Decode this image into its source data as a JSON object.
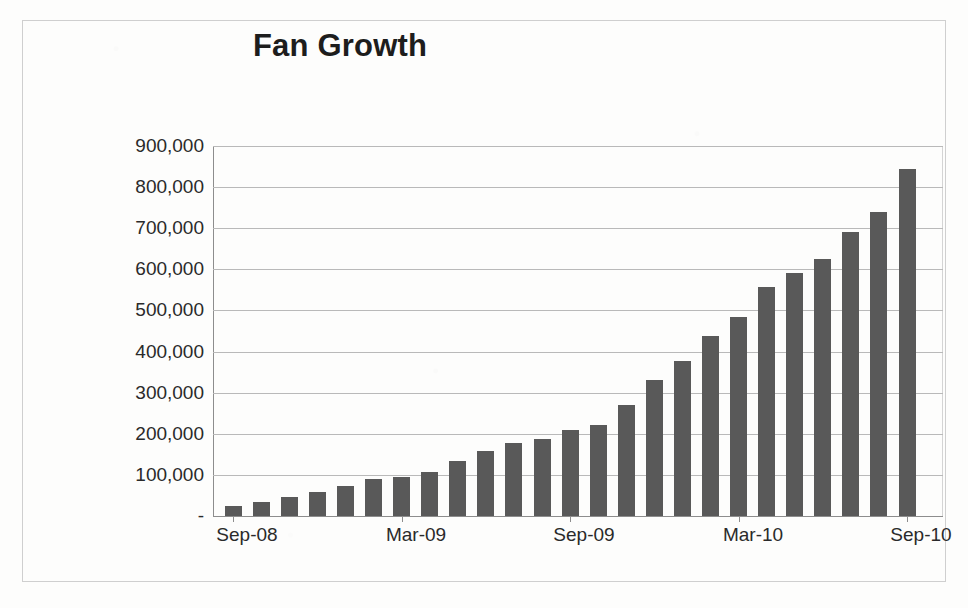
{
  "chart_data": {
    "type": "bar",
    "title": "Fan Growth",
    "xlabel": "",
    "ylabel": "",
    "ylim": [
      0,
      900000
    ],
    "grid": true,
    "legend": false,
    "y_ticks": [
      {
        "value": 900000,
        "label": "900,000"
      },
      {
        "value": 800000,
        "label": "800,000"
      },
      {
        "value": 700000,
        "label": "700,000"
      },
      {
        "value": 600000,
        "label": "600,000"
      },
      {
        "value": 500000,
        "label": "500,000"
      },
      {
        "value": 400000,
        "label": "400,000"
      },
      {
        "value": 300000,
        "label": "300,000"
      },
      {
        "value": 200000,
        "label": "200,000"
      },
      {
        "value": 100000,
        "label": "100,000"
      },
      {
        "value": 0,
        "label": "-"
      }
    ],
    "x_tick_labels": [
      "Sep-08",
      "Mar-09",
      "Sep-09",
      "Mar-10",
      "Sep-10"
    ],
    "x_tick_indices": [
      0,
      6,
      12,
      18,
      24
    ],
    "categories": [
      "Sep-08",
      "Oct-08",
      "Nov-08",
      "Dec-08",
      "Jan-09",
      "Feb-09",
      "Mar-09",
      "Apr-09",
      "May-09",
      "Jun-09",
      "Jul-09",
      "Aug-09",
      "Sep-09",
      "Oct-09",
      "Nov-09",
      "Dec-09",
      "Jan-10",
      "Feb-10",
      "Mar-10",
      "Apr-10",
      "May-10",
      "Jun-10",
      "Jul-10",
      "Aug-10",
      "Sep-10"
    ],
    "values": [
      25000,
      33000,
      45000,
      58000,
      73000,
      90000,
      95000,
      108000,
      133000,
      158000,
      177000,
      187000,
      208000,
      221000,
      270000,
      330000,
      378000,
      438000,
      485000,
      557000,
      590000,
      625000,
      692000,
      740000,
      845000
    ],
    "bar_color": "#595959",
    "axis_color": "#8d8d8d",
    "gridline_color": "#b9b9b9",
    "text_color": "#2a2a2a"
  }
}
